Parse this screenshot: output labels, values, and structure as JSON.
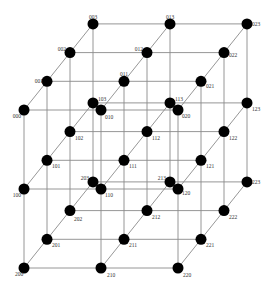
{
  "diagram": {
    "type": "3d-lattice",
    "dims": {
      "i": 3,
      "j": 3,
      "k": 4
    },
    "colors": {
      "node": "#000000",
      "edge": "#8a8a8a",
      "label": "#333333"
    },
    "geometry": {
      "origin": [
        24,
        110
      ],
      "step_j": [
        77,
        0
      ],
      "step_i": [
        0,
        79
      ],
      "step_k": [
        23,
        -28.7
      ]
    },
    "nodes": [
      {
        "id": "000",
        "label": "000",
        "lx": -3,
        "ly": 8,
        "anchor": "end"
      },
      {
        "id": "001",
        "label": "001",
        "lx": -4,
        "ly": 2,
        "anchor": "end"
      },
      {
        "id": "002",
        "label": "002",
        "lx": -4,
        "ly": -2,
        "anchor": "end"
      },
      {
        "id": "003",
        "label": "003",
        "lx": 0,
        "ly": -5,
        "anchor": "middle"
      },
      {
        "id": "010",
        "label": "010",
        "lx": 4,
        "ly": 9,
        "anchor": "start"
      },
      {
        "id": "011",
        "label": "011",
        "lx": 0,
        "ly": -5,
        "anchor": "middle"
      },
      {
        "id": "012",
        "label": "012",
        "lx": -4,
        "ly": -2,
        "anchor": "end"
      },
      {
        "id": "013",
        "label": "013",
        "lx": 0,
        "ly": -5,
        "anchor": "middle"
      },
      {
        "id": "020",
        "label": "020",
        "lx": 4,
        "ly": 8,
        "anchor": "start"
      },
      {
        "id": "021",
        "label": "021",
        "lx": 5,
        "ly": 7,
        "anchor": "start"
      },
      {
        "id": "022",
        "label": "022",
        "lx": 5,
        "ly": 4,
        "anchor": "start"
      },
      {
        "id": "023",
        "label": "023",
        "lx": 5,
        "ly": 2,
        "anchor": "start"
      },
      {
        "id": "100",
        "label": "100",
        "lx": -3,
        "ly": 8,
        "anchor": "end"
      },
      {
        "id": "101",
        "label": "101",
        "lx": 5,
        "ly": 8,
        "anchor": "start"
      },
      {
        "id": "102",
        "label": "102",
        "lx": 5,
        "ly": 8,
        "anchor": "start"
      },
      {
        "id": "103",
        "label": "103",
        "lx": 5,
        "ly": -2,
        "anchor": "start"
      },
      {
        "id": "110",
        "label": "110",
        "lx": 4,
        "ly": 8,
        "anchor": "start"
      },
      {
        "id": "111",
        "label": "111",
        "lx": 5,
        "ly": 8,
        "anchor": "start"
      },
      {
        "id": "112",
        "label": "112",
        "lx": 5,
        "ly": 8,
        "anchor": "start"
      },
      {
        "id": "113",
        "label": "113",
        "lx": 5,
        "ly": -2,
        "anchor": "start"
      },
      {
        "id": "120",
        "label": "120",
        "lx": 4,
        "ly": 6,
        "anchor": "start"
      },
      {
        "id": "121",
        "label": "121",
        "lx": 5,
        "ly": 8,
        "anchor": "start"
      },
      {
        "id": "122",
        "label": "122",
        "lx": 5,
        "ly": 8,
        "anchor": "start"
      },
      {
        "id": "123",
        "label": "123",
        "lx": 5,
        "ly": 8,
        "anchor": "start"
      },
      {
        "id": "200",
        "label": "200",
        "lx": -5,
        "ly": 8,
        "anchor": "middle"
      },
      {
        "id": "201",
        "label": "201",
        "lx": 5,
        "ly": 8,
        "anchor": "start"
      },
      {
        "id": "202",
        "label": "202",
        "lx": 4,
        "ly": 10,
        "anchor": "start"
      },
      {
        "id": "203",
        "label": "203",
        "lx": -4,
        "ly": -2,
        "anchor": "end"
      },
      {
        "id": "210",
        "label": "210",
        "lx": 6,
        "ly": 9,
        "anchor": "start"
      },
      {
        "id": "211",
        "label": "211",
        "lx": 5,
        "ly": 8,
        "anchor": "start"
      },
      {
        "id": "212",
        "label": "212",
        "lx": 5,
        "ly": 8,
        "anchor": "start"
      },
      {
        "id": "213",
        "label": "213",
        "lx": -4,
        "ly": -2,
        "anchor": "end"
      },
      {
        "id": "220",
        "label": "220",
        "lx": 5,
        "ly": 9,
        "anchor": "start"
      },
      {
        "id": "221",
        "label": "221",
        "lx": 5,
        "ly": 8,
        "anchor": "start"
      },
      {
        "id": "222",
        "label": "222",
        "lx": 5,
        "ly": 8,
        "anchor": "start"
      },
      {
        "id": "223",
        "label": "223",
        "lx": 5,
        "ly": 2,
        "anchor": "start"
      }
    ]
  }
}
